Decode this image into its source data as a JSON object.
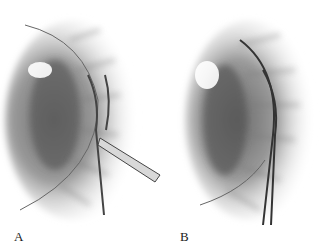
{
  "figure": {
    "panels": [
      {
        "label": "A",
        "subject": "iris-with-curved-scissors-illustration"
      },
      {
        "label": "B",
        "subject": "iris-with-curved-forceps-illustration"
      }
    ],
    "colors": {
      "background": "#ffffff",
      "ink": "#1a1a1a",
      "shade_dark": "#555555",
      "shade_light": "#bdbdbd"
    }
  }
}
